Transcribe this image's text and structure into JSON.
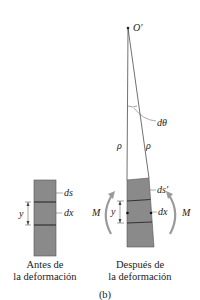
{
  "figure_label": "(b)",
  "before": {
    "caption_line1": "Antes de",
    "caption_line2": "la deformación",
    "labels": {
      "ds": "ds",
      "dx": "dx",
      "y": "y"
    }
  },
  "after": {
    "caption_line1": "Después de",
    "caption_line2": "la deformación",
    "labels": {
      "origin": "O′",
      "dtheta": "dθ",
      "rho_left": "ρ",
      "rho_right": "ρ",
      "ds_prime": "ds′",
      "dx": "dx",
      "y": "y",
      "moment_left": "M",
      "moment_right": "M"
    }
  },
  "colors": {
    "block_fill": "#8a8a8a",
    "line": "#333333",
    "arrow": "#9a9a9a"
  }
}
